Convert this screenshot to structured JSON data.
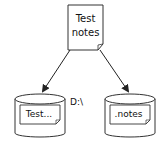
{
  "diagram": {
    "source_document": {
      "line1": "Test",
      "line2": "notes"
    },
    "drive_label": "D:\\",
    "left_store": {
      "file_label": "Test..."
    },
    "right_store": {
      "file_label": ".notes"
    }
  },
  "colors": {
    "stroke": "#222222",
    "background": "#ffffff"
  }
}
